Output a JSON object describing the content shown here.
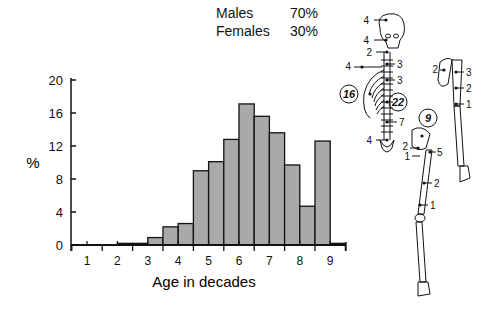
{
  "legend": {
    "rows": [
      {
        "label": "Males",
        "value": "70%"
      },
      {
        "label": "Females",
        "value": "30%"
      }
    ]
  },
  "chart_data": {
    "type": "bar",
    "title": "",
    "xlabel": "Age in decades",
    "ylabel": "%",
    "ylim": [
      0,
      20
    ],
    "yticks": [
      0,
      4,
      8,
      12,
      16,
      20
    ],
    "xticks": [
      1,
      2,
      3,
      4,
      5,
      6,
      7,
      8,
      9
    ],
    "xlim": [
      0.5,
      9.6
    ],
    "bin_width": 0.5,
    "grid": false,
    "bars": [
      {
        "x_start": 2.0,
        "x_end": 2.5,
        "value": 0.2
      },
      {
        "x_start": 2.5,
        "x_end": 3.0,
        "value": 0.2
      },
      {
        "x_start": 3.0,
        "x_end": 3.5,
        "value": 0.9
      },
      {
        "x_start": 3.5,
        "x_end": 4.0,
        "value": 2.2
      },
      {
        "x_start": 4.0,
        "x_end": 4.5,
        "value": 2.6
      },
      {
        "x_start": 4.5,
        "x_end": 5.0,
        "value": 9.0
      },
      {
        "x_start": 5.0,
        "x_end": 5.5,
        "value": 10.1
      },
      {
        "x_start": 5.5,
        "x_end": 6.0,
        "value": 12.8
      },
      {
        "x_start": 6.0,
        "x_end": 6.5,
        "value": 17.1
      },
      {
        "x_start": 6.5,
        "x_end": 7.0,
        "value": 15.6
      },
      {
        "x_start": 7.0,
        "x_end": 7.5,
        "value": 13.6
      },
      {
        "x_start": 7.5,
        "x_end": 8.0,
        "value": 9.7
      },
      {
        "x_start": 8.0,
        "x_end": 8.5,
        "value": 4.7
      },
      {
        "x_start": 8.5,
        "x_end": 9.0,
        "value": 12.6
      },
      {
        "x_start": 9.0,
        "x_end": 9.5,
        "value": 0.2
      }
    ],
    "colors": {
      "bar_fill": "#a9a9a9",
      "bar_stroke": "#111111",
      "axis": "#111111"
    }
  },
  "skeleton": {
    "skull": [
      "4",
      "4",
      "2"
    ],
    "spine": [
      "3",
      "3",
      "7"
    ],
    "clavicle": "4",
    "ribs": "16",
    "vertebra_circled": "22",
    "sacrum": "4",
    "pelvis": "9",
    "hip": [
      "2",
      "1",
      "5"
    ],
    "femur": [
      "2",
      "1"
    ],
    "scapula": "2",
    "humerus": [
      "3",
      "2",
      "1"
    ]
  }
}
